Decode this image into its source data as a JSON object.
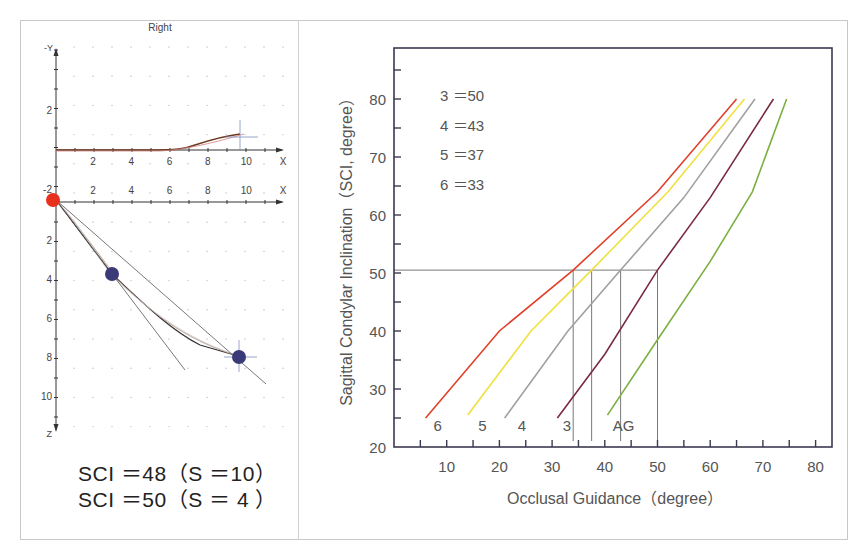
{
  "left_panel": {
    "title": "Right",
    "upper_plot": {
      "y_axis_label": "-Y",
      "y_ticks": [
        "2",
        "-2"
      ],
      "x_axis_label": "X",
      "x_ticks": [
        "2",
        "4",
        "6",
        "8",
        "10"
      ]
    },
    "lower_plot": {
      "x_axis_label": "X",
      "x_ticks": [
        "2",
        "4",
        "6",
        "8",
        "10"
      ],
      "z_axis_label": "Z",
      "z_ticks": [
        "2",
        "4",
        "6",
        "8",
        "10"
      ],
      "start_point_color": "#e8301e",
      "marker_color": "#3a3a78",
      "markers": [
        {
          "x": 3,
          "z": 3.8
        },
        {
          "x": 9.8,
          "z": 8.0
        }
      ]
    },
    "results": [
      "SCI ＝48（S ＝10）",
      "SCI ＝50（S ＝ 4 ）"
    ]
  },
  "chart_data": {
    "type": "line",
    "title": "",
    "xlabel": "Occlusal Guidance（degree）",
    "ylabel": "Sagittal Condylar Inclination（SCI, degree）",
    "xlim": [
      0,
      83
    ],
    "ylim": [
      20,
      89
    ],
    "x_ticks": [
      "10",
      "20",
      "30",
      "40",
      "50",
      "60",
      "70",
      "80"
    ],
    "y_ticks": [
      "20",
      "30",
      "40",
      "50",
      "60",
      "70",
      "80"
    ],
    "grid": false,
    "annotations": [
      "3 ＝50",
      "4 ＝43",
      "5 ＝37",
      "6 ＝33"
    ],
    "series": [
      {
        "name": "6",
        "color": "#e0402a",
        "points": [
          [
            6,
            25
          ],
          [
            20,
            40
          ],
          [
            34,
            50.5
          ],
          [
            50,
            64
          ],
          [
            65,
            80
          ]
        ]
      },
      {
        "name": "5",
        "color": "#f0e040",
        "points": [
          [
            14,
            25.5
          ],
          [
            26,
            40
          ],
          [
            37.5,
            50.5
          ],
          [
            52,
            64
          ],
          [
            66.5,
            80
          ]
        ]
      },
      {
        "name": "4",
        "color": "#a0a0a0",
        "points": [
          [
            21,
            25
          ],
          [
            33,
            40
          ],
          [
            43,
            50.5
          ],
          [
            55,
            63
          ],
          [
            68.5,
            80
          ]
        ]
      },
      {
        "name": "3",
        "color": "#7a2a48",
        "points": [
          [
            31,
            25
          ],
          [
            40,
            36
          ],
          [
            50,
            50.5
          ],
          [
            60,
            63
          ],
          [
            72,
            80
          ]
        ]
      },
      {
        "name": "AG",
        "color": "#7ab040",
        "points": [
          [
            40.5,
            25.5
          ],
          [
            50,
            38.5
          ],
          [
            60,
            52
          ],
          [
            68,
            64
          ],
          [
            74.5,
            80
          ]
        ]
      }
    ],
    "reference_lines": {
      "horizontal_y": 50.5,
      "vertical_x": [
        34,
        37.5,
        43,
        50
      ]
    },
    "curve_labels": [
      "6",
      "5",
      "4",
      "3",
      "AG"
    ]
  }
}
